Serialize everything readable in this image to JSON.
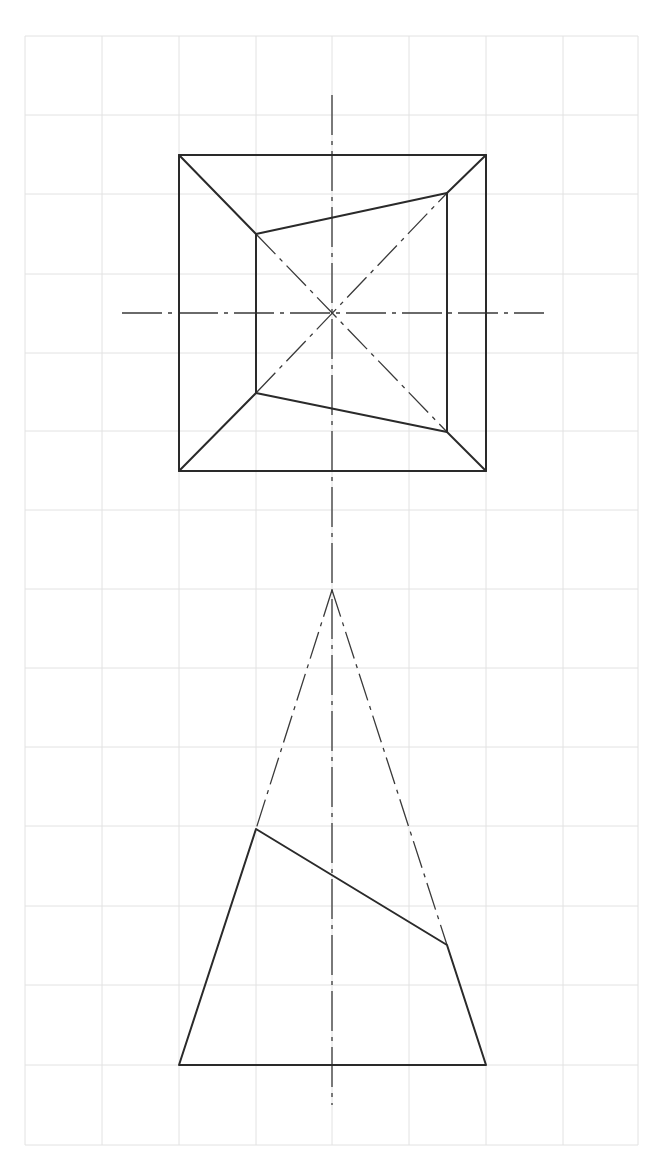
{
  "drawing": {
    "type": "orthographic projection",
    "subject": "truncated square pyramid cut by an inclined plane",
    "colors": {
      "line": "#2a2a2a",
      "grid": "#e2e2e2",
      "background": "#ffffff"
    },
    "grid": {
      "x": [
        25,
        102,
        179,
        256,
        332,
        409,
        486,
        563,
        638
      ],
      "y": [
        36,
        115,
        194,
        274,
        353,
        431,
        510,
        589,
        668,
        747,
        826,
        906,
        985,
        1065,
        1145
      ]
    },
    "top_view": {
      "outer_square": [
        [
          179,
          155
        ],
        [
          486,
          155
        ],
        [
          486,
          471
        ],
        [
          179,
          471
        ]
      ],
      "cut_section": [
        [
          256,
          234
        ],
        [
          447,
          193
        ],
        [
          447,
          432
        ],
        [
          256,
          393
        ]
      ],
      "center": [
        332,
        313
      ]
    },
    "front_view": {
      "apex": [
        332,
        590
      ],
      "base": [
        [
          179,
          1065
        ],
        [
          486,
          1065
        ]
      ],
      "cut_points": [
        [
          256,
          829
        ],
        [
          447,
          945
        ]
      ]
    }
  }
}
